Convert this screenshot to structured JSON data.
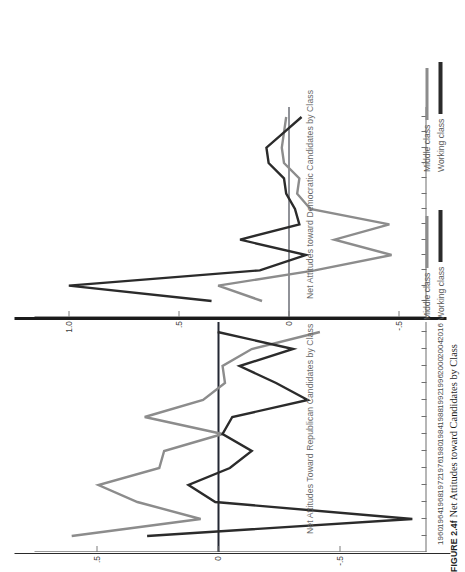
{
  "figure": {
    "number": "FIGURE 2.4f",
    "caption": "Net Attitudes toward Candidates by Class"
  },
  "legend": {
    "position": "bottom-right",
    "items": [
      {
        "label": "Middle class",
        "color": "#8c8c8c"
      },
      {
        "label": "Working class",
        "color": "#2b2b2b"
      }
    ]
  },
  "colors": {
    "middle_class": "#8c8c8c",
    "working_class": "#2b2b2b",
    "axis": "#6f6f6f",
    "zero_line": "#232733",
    "divider": "#1b1b1b",
    "title_text": "#6a6a6a"
  },
  "chart_data": [
    {
      "id": "republican",
      "type": "line",
      "title": "Net Attitudes Toward Republican Candidates by Class",
      "xlabel": "",
      "ylabel": "",
      "grid": false,
      "zero_reference_line": 0,
      "ylim": [
        -0.85,
        0.72
      ],
      "yticks": [
        -0.5,
        0,
        0.5
      ],
      "ytick_labels": [
        "-.5",
        "0",
        ".5"
      ],
      "x": [
        1960,
        1964,
        1968,
        1972,
        1976,
        1980,
        1984,
        1988,
        1992,
        1996,
        2000,
        2004,
        2016
      ],
      "xtick_labels": [
        "1960",
        "1964",
        "1968",
        "1972",
        "1976",
        "1980",
        "1984",
        "1988",
        "1992",
        "1996",
        "2000",
        "2004",
        "2016"
      ],
      "series": [
        {
          "name": "Middle class",
          "color": "#8c8c8c",
          "values": [
            0.6,
            0.07,
            0.33,
            0.49,
            0.24,
            0.22,
            -0.02,
            0.3,
            0.06,
            -0.03,
            -0.02,
            -0.14,
            -0.42
          ]
        },
        {
          "name": "Working class",
          "color": "#2b2b2b",
          "values": [
            0.29,
            -0.8,
            0.01,
            0.12,
            -0.05,
            -0.14,
            -0.02,
            -0.06,
            -0.37,
            -0.24,
            -0.09,
            -0.31,
            0.0
          ]
        }
      ]
    },
    {
      "id": "democratic",
      "type": "line",
      "title": "Net Attitudes toward Democratic Candidates by Class",
      "xlabel": "",
      "ylabel": "",
      "grid": false,
      "zero_reference_line": 0,
      "ylim": [
        -0.62,
        1.12
      ],
      "yticks": [
        -0.5,
        0,
        0.5,
        1.0
      ],
      "ytick_labels": [
        "-.5",
        "0",
        ".5",
        "1.0"
      ],
      "x": [
        1960,
        1964,
        1968,
        1972,
        1976,
        1980,
        1984,
        1988,
        1992,
        1996,
        2000,
        2004,
        2016
      ],
      "xtick_labels": [
        "1960",
        "1964",
        "1968",
        "1972",
        "1976",
        "1980",
        "1984",
        "1988",
        "1992",
        "1996",
        "2000",
        "2004",
        "2016"
      ],
      "series": [
        {
          "name": "Middle class",
          "color": "#8c8c8c",
          "values": [
            0.12,
            0.32,
            -0.12,
            -0.47,
            -0.21,
            -0.46,
            -0.1,
            -0.04,
            -0.05,
            0.02,
            0.03,
            0.02,
            0.01
          ]
        },
        {
          "name": "Working class",
          "color": "#2b2b2b",
          "values": [
            0.35,
            1.0,
            0.13,
            -0.08,
            0.22,
            -0.05,
            -0.03,
            0.01,
            0.02,
            0.09,
            0.1,
            0.02,
            -0.06
          ]
        }
      ]
    }
  ]
}
